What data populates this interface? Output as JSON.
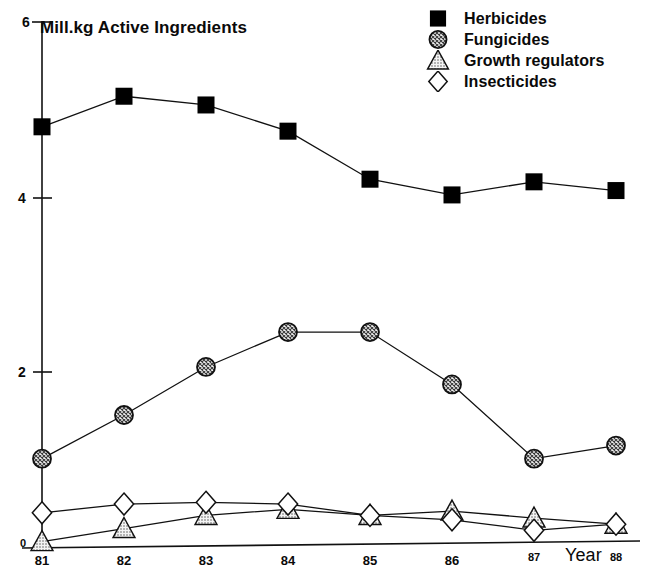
{
  "chart_data": {
    "type": "line",
    "title": "",
    "xlabel": "Year",
    "ylabel": "Mill.kg Active Ingredients",
    "categories": [
      "81",
      "82",
      "83",
      "84",
      "85",
      "86",
      "87",
      "88"
    ],
    "x": [
      81,
      82,
      83,
      84,
      85,
      86,
      87,
      88
    ],
    "xlim": [
      81,
      88
    ],
    "ylim": [
      0,
      6
    ],
    "yticks": [
      0,
      2,
      4,
      6
    ],
    "ytick_labels": [
      "0",
      "2",
      "4",
      "6"
    ],
    "grid": false,
    "legend_position": "top-right",
    "series": [
      {
        "name": "Herbicides",
        "marker": "filled-square",
        "marker_color": "#000000",
        "values": [
          4.8,
          5.15,
          5.05,
          4.75,
          4.2,
          4.02,
          4.17,
          4.07
        ]
      },
      {
        "name": "Fungicides",
        "marker": "hatched-circle",
        "marker_color": "#9a9a9a",
        "values": [
          1.0,
          1.5,
          2.05,
          2.45,
          2.45,
          1.85,
          1.0,
          1.15
        ]
      },
      {
        "name": "Growth regulators",
        "marker": "stippled-triangle",
        "marker_color": "#cccccc",
        "values": [
          0.05,
          0.2,
          0.35,
          0.42,
          0.35,
          0.4,
          0.32,
          0.25
        ]
      },
      {
        "name": "Insecticides",
        "marker": "open-diamond",
        "marker_color": "#ffffff",
        "values": [
          0.38,
          0.48,
          0.5,
          0.48,
          0.35,
          0.3,
          0.18,
          0.25
        ]
      }
    ]
  },
  "axes": {
    "y_top_label": "6",
    "y_label_4": "4",
    "y_label_2": "2",
    "y_label_0": "0",
    "y_title": "Mill.kg Active Ingredients",
    "x_title": "Year",
    "x_labels": [
      "81",
      "82",
      "83",
      "84",
      "85",
      "86",
      "87",
      "88"
    ]
  },
  "legend": {
    "entries": [
      {
        "label": "Herbicides"
      },
      {
        "label": "Fungicides"
      },
      {
        "label": "Growth regulators"
      },
      {
        "label": "Insecticides"
      }
    ]
  }
}
